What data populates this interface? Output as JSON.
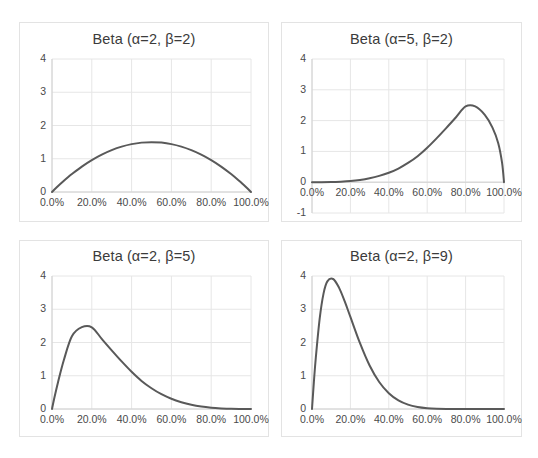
{
  "figure": {
    "background": "#ffffff",
    "panel_border_color": "#e3e3e3",
    "grid_color": "#e6e6e6",
    "axis_color": "#d0d0d0",
    "line_color": "#595959",
    "text_color": "#4a4a4a",
    "title_color": "#3b3b3b",
    "layout": "2x2 grid of small-multiple line charts"
  },
  "chart_data": [
    {
      "id": "beta-2-2",
      "type": "line",
      "title": "Beta (α=2, β=2)",
      "xlabel": "",
      "ylabel": "",
      "xlim": [
        0,
        1
      ],
      "ylim": [
        0,
        4
      ],
      "grid": true,
      "legend": "none",
      "alpha": 2,
      "beta": 2,
      "peak_x": 0.5,
      "peak_y": 1.5,
      "xticks": [
        0,
        0.2,
        0.4,
        0.6,
        0.8,
        1.0
      ],
      "xtick_labels": [
        "0.0%",
        "20.0%",
        "40.0%",
        "60.0%",
        "80.0%",
        "100.0%"
      ],
      "yticks": [
        0,
        1,
        2,
        3,
        4
      ],
      "ytick_labels": [
        "0",
        "1",
        "2",
        "3",
        "4"
      ],
      "x": [
        0.0,
        0.02,
        0.04,
        0.06,
        0.08,
        0.1,
        0.15,
        0.2,
        0.25,
        0.3,
        0.35,
        0.4,
        0.45,
        0.5,
        0.55,
        0.6,
        0.65,
        0.7,
        0.75,
        0.8,
        0.85,
        0.9,
        0.94,
        0.96,
        0.98,
        1.0
      ],
      "y": [
        0.0,
        0.118,
        0.23,
        0.338,
        0.442,
        0.54,
        0.765,
        0.96,
        1.125,
        1.26,
        1.365,
        1.44,
        1.485,
        1.5,
        1.485,
        1.44,
        1.365,
        1.26,
        1.125,
        0.96,
        0.765,
        0.54,
        0.338,
        0.23,
        0.118,
        0.0
      ]
    },
    {
      "id": "beta-5-2",
      "type": "line",
      "title": "Beta (α=5, β=2)",
      "xlabel": "",
      "ylabel": "",
      "xlim": [
        0,
        1
      ],
      "ylim": [
        -1,
        4
      ],
      "grid": true,
      "legend": "none",
      "alpha": 5,
      "beta": 2,
      "peak_x": 0.8,
      "peak_y": 2.46,
      "xticks": [
        0,
        0.2,
        0.4,
        0.6,
        0.8,
        1.0
      ],
      "xtick_labels": [
        "0.0%",
        "20.0%",
        "40.0%",
        "60.0%",
        "80.0%",
        "100.0%"
      ],
      "yticks": [
        -1,
        0,
        1,
        2,
        3,
        4
      ],
      "ytick_labels": [
        "-1",
        "0",
        "1",
        "2",
        "3",
        "4"
      ],
      "x": [
        0.0,
        0.05,
        0.1,
        0.15,
        0.2,
        0.25,
        0.3,
        0.35,
        0.4,
        0.45,
        0.5,
        0.55,
        0.6,
        0.65,
        0.7,
        0.75,
        0.8,
        0.85,
        0.9,
        0.94,
        0.97,
        0.99,
        1.0
      ],
      "y": [
        0.0,
        0.0,
        0.005,
        0.018,
        0.038,
        0.073,
        0.128,
        0.205,
        0.307,
        0.444,
        0.625,
        0.845,
        1.12,
        1.432,
        1.765,
        2.109,
        2.458,
        2.46,
        2.187,
        1.773,
        1.266,
        0.625,
        0.0
      ]
    },
    {
      "id": "beta-2-5",
      "type": "line",
      "title": "Beta (α=2, β=5)",
      "xlabel": "",
      "ylabel": "",
      "xlim": [
        0,
        1
      ],
      "ylim": [
        0,
        4
      ],
      "grid": true,
      "legend": "none",
      "alpha": 2,
      "beta": 5,
      "peak_x": 0.2,
      "peak_y": 2.46,
      "xticks": [
        0,
        0.2,
        0.4,
        0.6,
        0.8,
        1.0
      ],
      "xtick_labels": [
        "0.0%",
        "20.0%",
        "40.0%",
        "60.0%",
        "80.0%",
        "100.0%"
      ],
      "yticks": [
        0,
        1,
        2,
        3,
        4
      ],
      "ytick_labels": [
        "0",
        "1",
        "2",
        "3",
        "4"
      ],
      "x": [
        0.0,
        0.01,
        0.03,
        0.06,
        0.1,
        0.15,
        0.2,
        0.25,
        0.3,
        0.35,
        0.4,
        0.45,
        0.5,
        0.55,
        0.6,
        0.65,
        0.7,
        0.75,
        0.8,
        0.85,
        0.9,
        0.95,
        1.0
      ],
      "y": [
        0.0,
        0.288,
        0.8,
        1.48,
        2.187,
        2.46,
        2.458,
        2.109,
        1.765,
        1.432,
        1.12,
        0.845,
        0.625,
        0.444,
        0.307,
        0.205,
        0.128,
        0.073,
        0.038,
        0.018,
        0.005,
        0.001,
        0.0
      ]
    },
    {
      "id": "beta-2-9",
      "type": "line",
      "title": "Beta (α=2, β=9)",
      "xlabel": "",
      "ylabel": "",
      "xlim": [
        0,
        1
      ],
      "ylim": [
        0,
        4
      ],
      "grid": true,
      "legend": "none",
      "alpha": 2,
      "beta": 9,
      "peak_x": 0.111,
      "peak_y": 3.9,
      "xticks": [
        0,
        0.2,
        0.4,
        0.6,
        0.8,
        1.0
      ],
      "xtick_labels": [
        "0.0%",
        "20.0%",
        "40.0%",
        "60.0%",
        "80.0%",
        "100.0%"
      ],
      "yticks": [
        0,
        1,
        2,
        3,
        4
      ],
      "ytick_labels": [
        "0",
        "1",
        "2",
        "3",
        "4"
      ],
      "x": [
        0.0,
        0.01,
        0.02,
        0.04,
        0.06,
        0.08,
        0.11,
        0.14,
        0.17,
        0.2,
        0.25,
        0.3,
        0.35,
        0.4,
        0.45,
        0.5,
        0.55,
        0.6,
        0.65,
        0.7,
        0.8,
        0.9,
        1.0
      ],
      "y": [
        0.0,
        0.83,
        1.552,
        2.717,
        3.47,
        3.838,
        3.91,
        3.657,
        3.243,
        2.769,
        1.979,
        1.307,
        0.812,
        0.475,
        0.26,
        0.132,
        0.061,
        0.025,
        0.009,
        0.003,
        0.0,
        0.0,
        0.0
      ]
    }
  ],
  "panels": [
    {
      "name": "panel-beta-2-2",
      "box": {
        "left": 19,
        "top": 22,
        "width": 250,
        "height": 200
      },
      "plot": {
        "left": 51,
        "top": 58,
        "width": 199,
        "height": 133
      },
      "title_top": 30
    },
    {
      "name": "panel-beta-5-2",
      "box": {
        "left": 281,
        "top": 22,
        "width": 241,
        "height": 200
      },
      "plot": {
        "left": 311,
        "top": 58,
        "width": 192,
        "height": 154
      },
      "title_top": 30
    },
    {
      "name": "panel-beta-2-5",
      "box": {
        "left": 19,
        "top": 240,
        "width": 250,
        "height": 197
      },
      "plot": {
        "left": 51,
        "top": 275,
        "width": 199,
        "height": 133
      },
      "title_top": 247
    },
    {
      "name": "panel-beta-2-9",
      "box": {
        "left": 281,
        "top": 240,
        "width": 241,
        "height": 197
      },
      "plot": {
        "left": 311,
        "top": 275,
        "width": 192,
        "height": 133
      },
      "title_top": 247
    }
  ]
}
